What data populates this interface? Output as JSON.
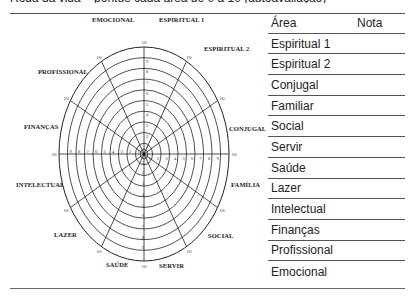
{
  "page": {
    "cut_heading": "Roda da vida – pontue cada área de 0 a 10 (autoavaliação)"
  },
  "wheel": {
    "scale_max": "10",
    "scale_ticks": [
      "1",
      "2",
      "3",
      "4",
      "5",
      "6",
      "7",
      "8",
      "9",
      "10"
    ],
    "segments": [
      {
        "label": "ESPIRITUAL 1"
      },
      {
        "label": "ESPIRITUAL 2"
      },
      {
        "label": "CONJUGAL"
      },
      {
        "label": "FAMÍLIA"
      },
      {
        "label": "SOCIAL"
      },
      {
        "label": "SERVIR"
      },
      {
        "label": "SAÚDE"
      },
      {
        "label": "LAZER"
      },
      {
        "label": "INTELECTUAL"
      },
      {
        "label": "FINANÇAS"
      },
      {
        "label": "PROFISSIONAL"
      },
      {
        "label": "EMOCIONAL"
      }
    ]
  },
  "table": {
    "headers": {
      "area": "Área",
      "nota": "Nota"
    },
    "rows": [
      {
        "area": "Espiritual 1",
        "nota": ""
      },
      {
        "area": "Espiritual 2",
        "nota": ""
      },
      {
        "area": "Conjugal",
        "nota": ""
      },
      {
        "area": "Familiar",
        "nota": ""
      },
      {
        "area": "Social",
        "nota": ""
      },
      {
        "area": "Servir",
        "nota": ""
      },
      {
        "area": "Saúde",
        "nota": ""
      },
      {
        "area": "Lazer",
        "nota": ""
      },
      {
        "area": "Intelectual",
        "nota": ""
      },
      {
        "area": "Finanças",
        "nota": ""
      },
      {
        "area": "Profissional",
        "nota": ""
      },
      {
        "area": "Emocional",
        "nota": ""
      }
    ]
  }
}
